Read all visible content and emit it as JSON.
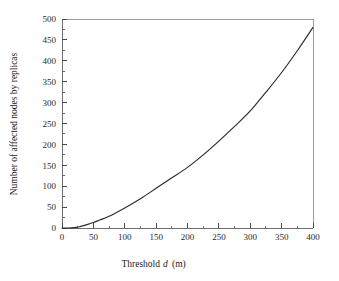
{
  "chart_data": {
    "type": "line",
    "title": "",
    "xlabel": "Threshold d (m)",
    "xlabel_prefix": "Threshold",
    "xlabel_variable": "d",
    "xlabel_units": "(m)",
    "ylabel": "Number of affected nodes by replicas",
    "xlim": [
      0,
      400
    ],
    "ylim": [
      0,
      500
    ],
    "x_major_ticks": [
      0,
      50,
      100,
      150,
      200,
      250,
      300,
      350,
      400
    ],
    "x_tick_labels": [
      "0",
      "50",
      "100",
      "150",
      "200",
      "250",
      "300",
      "350",
      "400"
    ],
    "x_minor_tick_interval": 25,
    "y_major_ticks": [
      0,
      50,
      100,
      150,
      200,
      250,
      300,
      350,
      400,
      450,
      500
    ],
    "y_tick_labels": [
      "0",
      "50",
      "100",
      "150",
      "200",
      "250",
      "300",
      "350",
      "400",
      "450",
      "500"
    ],
    "y_minor_tick_interval": 25,
    "grid": false,
    "legend": null,
    "series": [
      {
        "name": "affected nodes by replicas",
        "color": "#2b2b2b",
        "x": [
          0,
          10,
          20,
          25,
          30,
          40,
          50,
          60,
          75,
          100,
          125,
          150,
          175,
          200,
          225,
          250,
          275,
          300,
          325,
          350,
          375,
          400
        ],
        "values": [
          0,
          0,
          1,
          2,
          4,
          8,
          13,
          19,
          28,
          48,
          70,
          95,
          120,
          145,
          175,
          208,
          243,
          280,
          325,
          372,
          424,
          480
        ]
      }
    ]
  },
  "figure": {
    "frame_color": "#9a9a9a",
    "axis_color": "#6f6f6f",
    "background": "#ffffff"
  }
}
